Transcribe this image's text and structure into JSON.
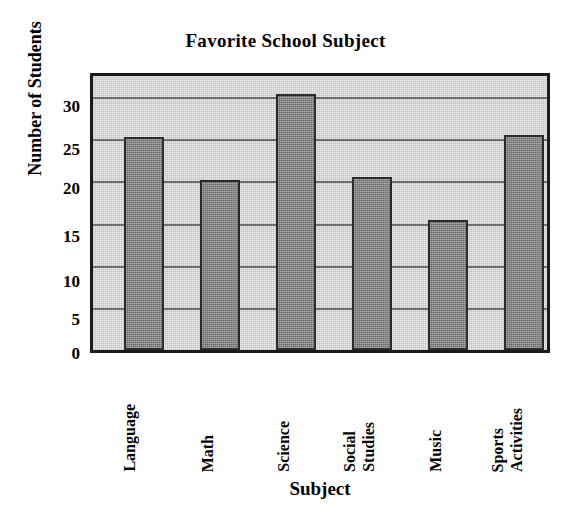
{
  "chart_data": {
    "type": "bar",
    "title": "Favorite School Subject",
    "xlabel": "Subject",
    "ylabel": "Number of Students",
    "categories": [
      "Language",
      "Math",
      "Science",
      "Social Studies",
      "Music",
      "Sports Activities"
    ],
    "values": [
      25.3,
      20.2,
      30.4,
      20.5,
      15.4,
      25.5
    ],
    "ylim": [
      0,
      32.5
    ],
    "yticks": [
      0,
      5,
      10,
      15,
      20,
      25,
      30
    ],
    "ytick_labels": [
      "0",
      "5",
      "10",
      "15",
      "20",
      "25",
      "30"
    ],
    "grid": true,
    "grid_axis": "y",
    "legend": null,
    "bar_color": "#7d7d7d",
    "bar_edge_color": "#2b2b2b",
    "plot_background": "#eeecec",
    "frame_color": "#1a1a1a",
    "gridline_color": "#6e6e6e",
    "category_label_rotation": 90
  }
}
